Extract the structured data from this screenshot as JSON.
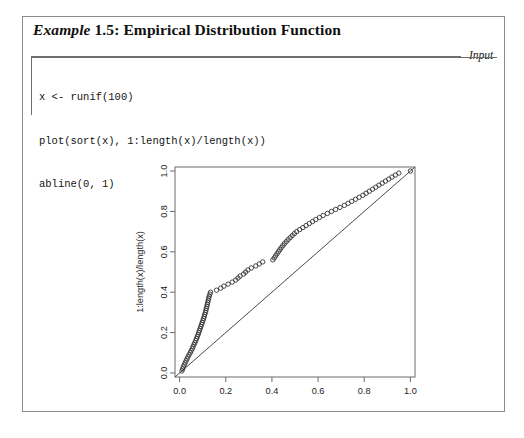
{
  "example": {
    "label": "Example",
    "number_and_title": "1.5: Empirical Distribution Function",
    "full_title": "Example 1.5: Empirical Distribution Function"
  },
  "input_section": {
    "label": "Input",
    "code_lines": [
      "x <- runif(100)",
      "plot(sort(x), 1:length(x)/length(x))",
      "abline(0, 1)"
    ]
  },
  "chart_data": {
    "type": "scatter",
    "title": "",
    "xlabel": "sort(x)",
    "ylabel": "1:length(x)/length(x)",
    "xlim": [
      -0.02,
      1.02
    ],
    "ylim": [
      -0.02,
      1.02
    ],
    "xticks": [
      "0.0",
      "0.2",
      "0.4",
      "0.6",
      "0.8",
      "1.0"
    ],
    "xtick_values": [
      0.0,
      0.2,
      0.4,
      0.6,
      0.8,
      1.0
    ],
    "yticks": [
      "0.0",
      "0.2",
      "0.4",
      "0.6",
      "0.8",
      "1.0"
    ],
    "ytick_values": [
      0.0,
      0.2,
      0.4,
      0.6,
      0.8,
      1.0
    ],
    "grid": false,
    "legend": "none",
    "marker": "open-circle",
    "annotations": [
      {
        "name": "reference-line",
        "type": "abline",
        "intercept": 0,
        "slope": 1
      }
    ],
    "series": [
      {
        "name": "ecdf",
        "x": [
          0.01,
          0.013,
          0.016,
          0.02,
          0.024,
          0.028,
          0.032,
          0.036,
          0.041,
          0.046,
          0.05,
          0.055,
          0.058,
          0.062,
          0.066,
          0.07,
          0.073,
          0.077,
          0.08,
          0.083,
          0.086,
          0.089,
          0.092,
          0.095,
          0.098,
          0.101,
          0.104,
          0.107,
          0.109,
          0.112,
          0.114,
          0.116,
          0.118,
          0.12,
          0.122,
          0.124,
          0.126,
          0.128,
          0.131,
          0.134,
          0.16,
          0.178,
          0.192,
          0.21,
          0.228,
          0.243,
          0.253,
          0.262,
          0.277,
          0.286,
          0.296,
          0.311,
          0.33,
          0.345,
          0.36,
          0.404,
          0.41,
          0.416,
          0.422,
          0.428,
          0.434,
          0.44,
          0.447,
          0.454,
          0.462,
          0.47,
          0.479,
          0.488,
          0.497,
          0.507,
          0.52,
          0.534,
          0.548,
          0.562,
          0.576,
          0.59,
          0.606,
          0.622,
          0.64,
          0.658,
          0.676,
          0.695,
          0.714,
          0.73,
          0.746,
          0.762,
          0.778,
          0.794,
          0.808,
          0.822,
          0.836,
          0.85,
          0.864,
          0.878,
          0.892,
          0.906,
          0.92,
          0.935,
          0.95,
          1.0
        ],
        "y": [
          0.01,
          0.02,
          0.03,
          0.04,
          0.05,
          0.06,
          0.07,
          0.08,
          0.09,
          0.1,
          0.11,
          0.12,
          0.13,
          0.14,
          0.15,
          0.16,
          0.17,
          0.18,
          0.19,
          0.2,
          0.21,
          0.22,
          0.23,
          0.24,
          0.25,
          0.26,
          0.27,
          0.28,
          0.29,
          0.3,
          0.31,
          0.32,
          0.33,
          0.34,
          0.35,
          0.36,
          0.37,
          0.38,
          0.39,
          0.4,
          0.41,
          0.42,
          0.43,
          0.44,
          0.45,
          0.46,
          0.47,
          0.48,
          0.49,
          0.5,
          0.51,
          0.52,
          0.53,
          0.54,
          0.55,
          0.56,
          0.57,
          0.58,
          0.59,
          0.6,
          0.61,
          0.62,
          0.63,
          0.64,
          0.65,
          0.66,
          0.67,
          0.68,
          0.69,
          0.7,
          0.71,
          0.72,
          0.73,
          0.74,
          0.75,
          0.76,
          0.77,
          0.78,
          0.79,
          0.8,
          0.81,
          0.82,
          0.83,
          0.84,
          0.85,
          0.86,
          0.87,
          0.88,
          0.89,
          0.9,
          0.91,
          0.92,
          0.93,
          0.94,
          0.95,
          0.96,
          0.97,
          0.98,
          0.99,
          1.0
        ]
      }
    ]
  }
}
